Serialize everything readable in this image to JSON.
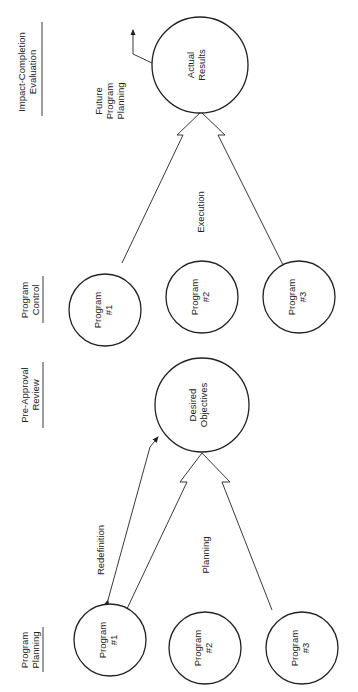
{
  "stages": {
    "program_planning": {
      "line1": "Program",
      "line2": "Planning"
    },
    "pre_approval_review": {
      "line1": "Pre-Approval",
      "line2": "Review"
    },
    "program_control": {
      "line1": "Program",
      "line2": "Control"
    },
    "impact_completion_evaluation": {
      "line1": "Impact-Completion",
      "line2": "Evaluation"
    }
  },
  "nodes": {
    "planning_program_1": {
      "line1": "Program",
      "line2": "#1"
    },
    "planning_program_2": {
      "line1": "Program",
      "line2": "#2"
    },
    "planning_program_3": {
      "line1": "Program",
      "line2": "#3"
    },
    "desired_objectives": {
      "line1": "Desired",
      "line2": "Objectives"
    },
    "control_program_1": {
      "line1": "Program",
      "line2": "#1"
    },
    "control_program_2": {
      "line1": "Program",
      "line2": "#2"
    },
    "control_program_3": {
      "line1": "Program",
      "line2": "#3"
    },
    "actual_results": {
      "line1": "Actual",
      "line2": "Results"
    }
  },
  "edges": {
    "redefinition": "Redefinition",
    "planning": "Planning",
    "execution": "Execution",
    "future_program_planning": {
      "line1": "Future",
      "line2": "Program",
      "line3": "Planning"
    }
  }
}
